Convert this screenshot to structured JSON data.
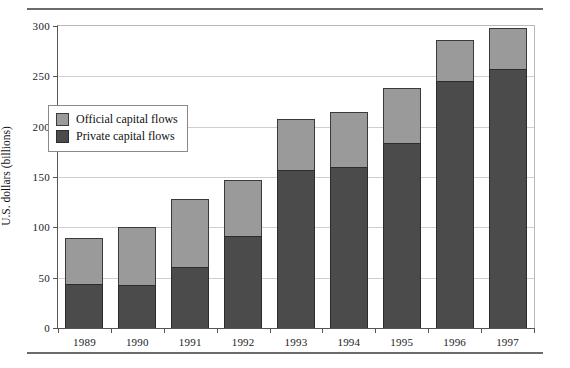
{
  "chart_data": {
    "type": "bar",
    "stacked": true,
    "title": "",
    "xlabel": "",
    "ylabel": "U.S. dollars (billions)",
    "ylim": [
      0,
      300
    ],
    "yticks": [
      0,
      50,
      100,
      150,
      200,
      250,
      300
    ],
    "ytick_labels": [
      "0",
      "50",
      "100",
      "150",
      "200",
      "250",
      "300"
    ],
    "grid": true,
    "legend_position": "upper left inside",
    "categories": [
      "1989",
      "1990",
      "1991",
      "1992",
      "1993",
      "1994",
      "1995",
      "1996",
      "1997"
    ],
    "series": [
      {
        "name": "Private capital flows",
        "color": "#4b4b4b",
        "values": [
          44,
          43,
          61,
          91,
          157,
          160,
          184,
          245,
          257
        ]
      },
      {
        "name": "Official capital flows",
        "color": "#9a9a9a",
        "values": [
          45,
          57,
          67,
          56,
          51,
          55,
          54,
          41,
          41
        ]
      }
    ],
    "totals": [
      89,
      100,
      128,
      147,
      208,
      215,
      238,
      286,
      298
    ]
  },
  "legend": {
    "items": [
      {
        "label": "Official capital flows",
        "swatch": "official"
      },
      {
        "label": "Private capital flows",
        "swatch": "private"
      }
    ]
  },
  "colors": {
    "official": "#9a9a9a",
    "private": "#4b4b4b",
    "grid": "#cfcfcf",
    "axis": "#555555",
    "rule": "#6b6b6b"
  }
}
